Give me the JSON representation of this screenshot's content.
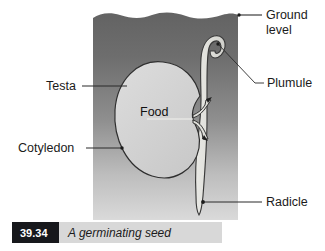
{
  "figure": {
    "title": "A germinating seed",
    "caption_number": "39.34",
    "labels": {
      "ground_level_line1": "Ground",
      "ground_level_line2": "level",
      "plumule": "Plumule",
      "testa": "Testa",
      "cotyledon": "Cotyledon",
      "food": "Food",
      "radicle": "Radicle"
    },
    "colors": {
      "soil_top": "#6e6e6e",
      "soil_bottom": "#d6d6d6",
      "seed_fill": "#d2d2d2",
      "seedling_fill": "#e2e2dd",
      "outline": "#2a2a2a",
      "caption_box": "#17181c",
      "caption_bar": "#d8d8d8",
      "text": "#1b1b1b",
      "page_background": "#ffffff"
    }
  }
}
